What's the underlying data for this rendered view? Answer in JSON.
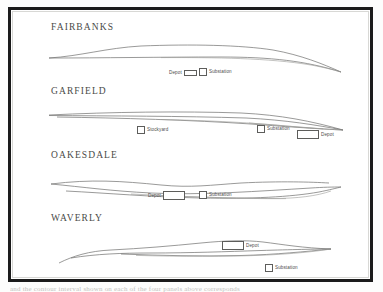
{
  "document": {
    "background_color": "#ffffff",
    "frame_color": "#1b1b1b",
    "line_color": "#6f6f6d",
    "title_color": "#4a4a48",
    "bottom_cut_text": "and the contour interval shown on each of the four panels above corresponds"
  },
  "panels": [
    {
      "title": "FAIRBANKS",
      "markers": [
        {
          "label": "Depot",
          "swatch": "wide"
        },
        {
          "label": "Substation",
          "swatch": "sq"
        }
      ]
    },
    {
      "title": "GARFIELD",
      "markers": [
        {
          "label": "Stockyard",
          "swatch": "sq"
        },
        {
          "label": "Substation",
          "swatch": "sq"
        },
        {
          "label": "Depot",
          "swatch": "wide-lg"
        }
      ]
    },
    {
      "title": "OAKESDALE",
      "markers": [
        {
          "label": "Depot",
          "swatch": "wide-lg"
        },
        {
          "label": "Substation",
          "swatch": "sq"
        }
      ]
    },
    {
      "title": "WAVERLY",
      "markers": [
        {
          "label": "Depot",
          "swatch": "wide-lg"
        },
        {
          "label": "Substation",
          "swatch": "sq"
        }
      ]
    }
  ]
}
